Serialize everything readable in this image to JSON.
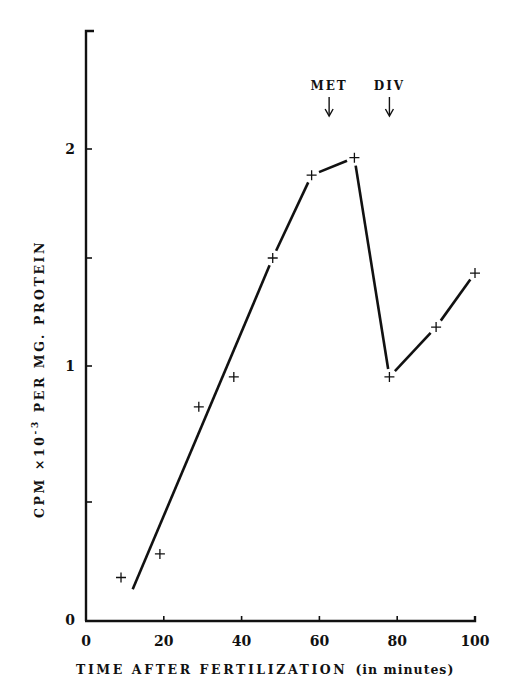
{
  "chart_data": {
    "type": "line",
    "title": "",
    "xlabel": "TIME AFTER FERTILIZATION",
    "xlabel_suffix": "(in minutes)",
    "ylabel": "CPM ×10⁻³ PER MG. PROTEIN",
    "ylabel_parts": {
      "pre": "CPM ×10",
      "sup": "-3",
      "post": " PER MG. PROTEIN"
    },
    "xlim": [
      0,
      100
    ],
    "ylim": [
      0,
      2.5
    ],
    "x_ticks": [
      0,
      20,
      40,
      60,
      80,
      100
    ],
    "x_tick_labels": [
      "0",
      "20",
      "40",
      "60",
      "80",
      "100"
    ],
    "y_ticks": [
      0,
      0.5,
      1,
      1.5,
      2
    ],
    "y_tick_labels": [
      "0",
      "",
      "1",
      "",
      "2"
    ],
    "grid": false,
    "legend": null,
    "series": [
      {
        "name": "measured",
        "marker": "+",
        "x": [
          9,
          19,
          29,
          38,
          48,
          58,
          69,
          78,
          90,
          100
        ],
        "y": [
          0.18,
          0.28,
          0.85,
          0.96,
          1.5,
          1.88,
          1.96,
          0.96,
          1.18,
          1.43
        ]
      },
      {
        "name": "fitted line",
        "marker": "none",
        "x": [
          12,
          48,
          58,
          69,
          78,
          90,
          100
        ],
        "y": [
          0.13,
          1.5,
          1.88,
          1.96,
          0.96,
          1.18,
          1.43
        ]
      }
    ],
    "annotations": [
      {
        "text": "MET",
        "x": 62.5,
        "arrow": "down"
      },
      {
        "text": "DIV",
        "x": 78,
        "arrow": "down"
      }
    ]
  },
  "colors": {
    "ink": "#111111",
    "background": "#ffffff"
  }
}
